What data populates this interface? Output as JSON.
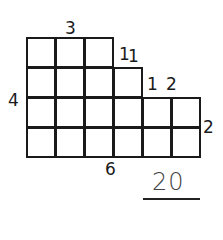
{
  "figure": {
    "rows": [
      {
        "row": 0,
        "columns": 3
      },
      {
        "row": 1,
        "columns": 4
      },
      {
        "row": 2,
        "columns": 6
      },
      {
        "row": 3,
        "columns": 6
      }
    ],
    "labels": {
      "top": "3",
      "step1_vertical": "1",
      "step1_horizontal": "1",
      "step2_vertical": "1",
      "step2_horizontal": "2",
      "right": "2",
      "left": "4",
      "bottom": "6"
    },
    "answer": "20"
  }
}
